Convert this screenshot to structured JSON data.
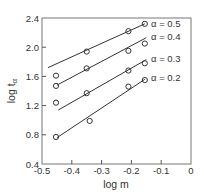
{
  "chart_data": {
    "type": "scatter",
    "title": "",
    "xlabel": "log m",
    "ylabel": "log t",
    "ylabel_subscript": "α",
    "xlim": [
      -0.5,
      0
    ],
    "ylim": [
      0.4,
      2.4
    ],
    "xticks": [
      -0.5,
      -0.4,
      -0.3,
      -0.2,
      -0.1,
      0
    ],
    "xtick_labels": [
      "-0.5",
      "-0.4",
      "-0.3",
      "-0.2",
      "-0.1",
      "0"
    ],
    "yticks": [
      0.4,
      0.8,
      1.2,
      1.6,
      2.0,
      2.4
    ],
    "ytick_labels": [
      "0.4",
      "0.8",
      "1.2",
      "1.6",
      "2.0",
      "2.4"
    ],
    "grid": false,
    "legend": "inline-right",
    "series": [
      {
        "name": "α = 0.5",
        "points": [
          [
            -0.453,
            1.61
          ],
          [
            -0.35,
            1.94
          ],
          [
            -0.21,
            2.22
          ],
          [
            -0.155,
            2.32
          ]
        ],
        "fit_line": [
          [
            -0.48,
            1.72
          ],
          [
            -0.155,
            2.32
          ]
        ]
      },
      {
        "name": "α = 0.4",
        "points": [
          [
            -0.453,
            1.47
          ],
          [
            -0.35,
            1.71
          ],
          [
            -0.21,
            1.95
          ],
          [
            -0.155,
            2.05
          ]
        ],
        "fit_line": [
          [
            -0.45,
            1.48
          ],
          [
            -0.15,
            2.13
          ]
        ]
      },
      {
        "name": "α = 0.3",
        "points": [
          [
            -0.453,
            1.24
          ],
          [
            -0.35,
            1.37
          ],
          [
            -0.21,
            1.68
          ],
          [
            -0.155,
            1.78
          ]
        ],
        "fit_line": [
          [
            -0.445,
            1.14
          ],
          [
            -0.15,
            1.83
          ]
        ]
      },
      {
        "name": "α = 0.2",
        "points": [
          [
            -0.453,
            0.77
          ],
          [
            -0.34,
            0.99
          ],
          [
            -0.21,
            1.46
          ],
          [
            -0.155,
            1.55
          ]
        ],
        "fit_line": [
          [
            -0.45,
            0.76
          ],
          [
            -0.155,
            1.56
          ]
        ]
      }
    ]
  }
}
